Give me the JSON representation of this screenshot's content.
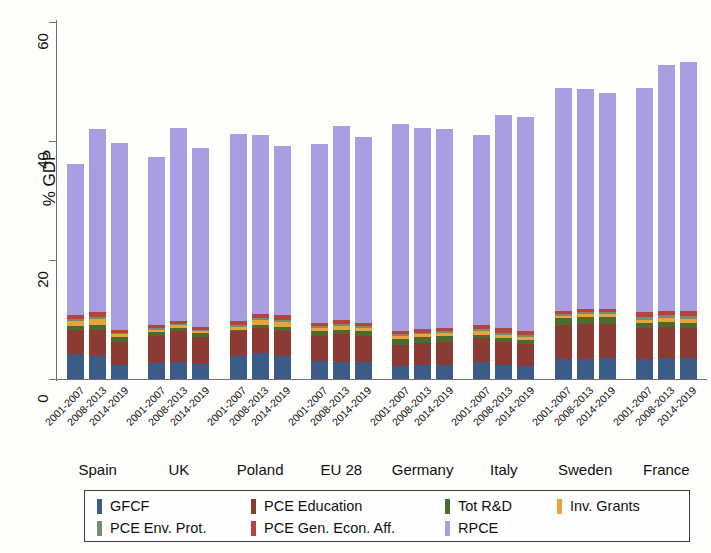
{
  "chart_data": {
    "type": "bar",
    "subtype": "stacked-bar-grouped",
    "title": "",
    "xlabel": "",
    "ylabel": "% GDP",
    "ylim": [
      0,
      60
    ],
    "yticks": [
      0,
      20,
      40,
      60
    ],
    "ytick_labels": [
      "0",
      "20",
      "40",
      "60"
    ],
    "grid": false,
    "legend_position": "below-axes",
    "groups": [
      "Spain",
      "UK",
      "Poland",
      "EU 28",
      "Germany",
      "Italy",
      "Sweden",
      "France"
    ],
    "periods": [
      "2001-2007",
      "2008-2013",
      "2014-2019"
    ],
    "series": [
      {
        "name": "GFCF",
        "color": "#3c5b87",
        "values": [
          [
            4.2,
            3.9,
            2.3
          ],
          [
            2.7,
            2.8,
            2.6
          ],
          [
            3.8,
            4.3,
            3.9
          ],
          [
            3.0,
            2.9,
            2.8
          ],
          [
            2.2,
            2.3,
            2.4
          ],
          [
            2.8,
            2.4,
            2.2
          ],
          [
            3.3,
            3.4,
            3.6
          ],
          [
            3.4,
            3.5,
            3.5
          ]
        ]
      },
      {
        "name": "PCE Education",
        "color": "#8c3a34",
        "values": [
          [
            4.0,
            4.4,
            4.0
          ],
          [
            4.6,
            5.2,
            4.5
          ],
          [
            4.2,
            4.2,
            4.1
          ],
          [
            4.3,
            4.6,
            4.4
          ],
          [
            3.6,
            3.8,
            3.9
          ],
          [
            4.1,
            3.9,
            3.7
          ],
          [
            5.7,
            5.8,
            5.6
          ],
          [
            5.1,
            5.2,
            5.1
          ]
        ]
      },
      {
        "name": "Tot R&D",
        "color": "#4d6b2e",
        "values": [
          [
            0.7,
            0.8,
            0.7
          ],
          [
            0.6,
            0.6,
            0.6
          ],
          [
            0.3,
            0.5,
            0.7
          ],
          [
            0.7,
            0.8,
            0.8
          ],
          [
            0.9,
            0.9,
            0.9
          ],
          [
            0.5,
            0.6,
            0.6
          ],
          [
            1.2,
            1.3,
            1.3
          ],
          [
            0.9,
            0.9,
            0.9
          ]
        ]
      },
      {
        "name": "Inv. Grants",
        "color": "#e5a53c",
        "values": [
          [
            0.8,
            1.0,
            0.5
          ],
          [
            0.4,
            0.4,
            0.3
          ],
          [
            0.4,
            0.9,
            0.9
          ],
          [
            0.5,
            0.6,
            0.5
          ],
          [
            0.5,
            0.5,
            0.5
          ],
          [
            0.6,
            0.5,
            0.5
          ],
          [
            0.4,
            0.4,
            0.4
          ],
          [
            0.6,
            0.6,
            0.6
          ]
        ]
      },
      {
        "name": "PCE Env. Prot.",
        "color": "#7b8a73",
        "values": [
          [
            0.4,
            0.4,
            0.3
          ],
          [
            0.3,
            0.3,
            0.3
          ],
          [
            0.3,
            0.3,
            0.3
          ],
          [
            0.4,
            0.4,
            0.4
          ],
          [
            0.3,
            0.3,
            0.3
          ],
          [
            0.4,
            0.4,
            0.4
          ],
          [
            0.3,
            0.3,
            0.3
          ],
          [
            0.5,
            0.5,
            0.5
          ]
        ]
      },
      {
        "name": "PCE Gen. Econ. Aff.",
        "color": "#b3453f",
        "values": [
          [
            0.6,
            0.7,
            0.5
          ],
          [
            0.4,
            0.5,
            0.4
          ],
          [
            0.7,
            0.8,
            0.8
          ],
          [
            0.6,
            0.7,
            0.6
          ],
          [
            0.6,
            0.6,
            0.6
          ],
          [
            0.7,
            0.7,
            0.7
          ],
          [
            0.6,
            0.6,
            0.6
          ],
          [
            0.8,
            0.8,
            0.8
          ]
        ]
      },
      {
        "name": "RPCE",
        "color": "#a99fe0",
        "values": [
          [
            25.5,
            30.8,
            31.3
          ],
          [
            28.3,
            32.4,
            30.1
          ],
          [
            31.5,
            30.1,
            28.5
          ],
          [
            30.0,
            32.6,
            31.1
          ],
          [
            34.7,
            33.8,
            33.5
          ],
          [
            32.0,
            35.9,
            35.9
          ],
          [
            37.5,
            36.9,
            36.3
          ],
          [
            37.7,
            41.3,
            41.9
          ]
        ]
      }
    ],
    "totals": [
      [
        36.2,
        42.0,
        39.6
      ],
      [
        37.3,
        42.2,
        38.8
      ],
      [
        41.2,
        41.1,
        39.2
      ],
      [
        39.5,
        42.6,
        40.6
      ],
      [
        42.8,
        42.2,
        42.1
      ],
      [
        41.1,
        44.4,
        44.0
      ],
      [
        49.0,
        48.7,
        48.1
      ],
      [
        49.0,
        52.8,
        53.3
      ]
    ]
  },
  "legend": {
    "items": [
      {
        "label": "GFCF",
        "color": "#3c5b87"
      },
      {
        "label": "PCE Education",
        "color": "#8c3a34"
      },
      {
        "label": "Tot R&D",
        "color": "#4d6b2e"
      },
      {
        "label": "Inv. Grants",
        "color": "#e5a53c"
      },
      {
        "label": "PCE Env. Prot.",
        "color": "#7b8a73"
      },
      {
        "label": "PCE Gen. Econ. Aff.",
        "color": "#b3453f"
      },
      {
        "label": "RPCE",
        "color": "#a99fe0"
      }
    ]
  }
}
